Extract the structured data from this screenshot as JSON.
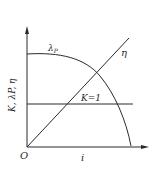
{
  "diagram": {
    "title": "",
    "axes": {
      "x_label": "i",
      "y_label": "K, λP, η",
      "origin_label": "O"
    },
    "curves": [
      {
        "name": "lambda_p",
        "label": "λ",
        "subscript": "P",
        "shape": "concave-down curve, flat start then falls to x-axis"
      },
      {
        "name": "eta",
        "label": "η",
        "shape": "straight line rising from origin"
      },
      {
        "name": "k",
        "label": "K=1",
        "shape": "horizontal line"
      }
    ],
    "colors": {
      "line": "#2a2a2a",
      "background": "#ffffff"
    }
  }
}
